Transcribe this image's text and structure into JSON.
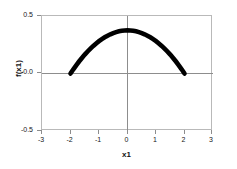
{
  "chart_data": {
    "type": "line",
    "title": "",
    "subtitle": "",
    "xlabel": "x1",
    "ylabel": "f(x1)",
    "xlim": [
      -3,
      3
    ],
    "ylim": [
      -0.5,
      0.5
    ],
    "xticks": [
      "-3",
      "-2",
      "-1",
      "0",
      "1",
      "2",
      "3"
    ],
    "xtick_values": [
      -3,
      -2,
      -1,
      0,
      1,
      2,
      3
    ],
    "yticks": [
      "0.5",
      "0.0",
      "-0.5"
    ],
    "ytick_values": [
      0.5,
      0.0,
      -0.5
    ],
    "grid": false,
    "legend": null,
    "annotations": [],
    "series": [
      {
        "name": "f(x1)",
        "color": "#000000",
        "linewidth": "thick",
        "x": [
          -2.0,
          -1.9,
          -1.8,
          -1.7,
          -1.6,
          -1.5,
          -1.4,
          -1.3,
          -1.2,
          -1.1,
          -1.0,
          -0.9,
          -0.8,
          -0.7,
          -0.6,
          -0.5,
          -0.4,
          -0.3,
          -0.2,
          -0.1,
          0.0,
          0.1,
          0.2,
          0.3,
          0.4,
          0.5,
          0.6,
          0.7,
          0.8,
          0.9,
          1.0,
          1.1,
          1.2,
          1.3,
          1.4,
          1.5,
          1.6,
          1.7,
          1.8,
          1.9,
          2.0
        ],
        "y": [
          0.0,
          0.0366,
          0.0713,
          0.1041,
          0.135,
          0.1641,
          0.1913,
          0.2166,
          0.24,
          0.2616,
          0.2813,
          0.299,
          0.315,
          0.329,
          0.3413,
          0.3516,
          0.36,
          0.3666,
          0.3713,
          0.374,
          0.375,
          0.374,
          0.3713,
          0.3666,
          0.36,
          0.3516,
          0.3413,
          0.329,
          0.315,
          0.299,
          0.2813,
          0.2616,
          0.24,
          0.2166,
          0.1913,
          0.1641,
          0.135,
          0.1041,
          0.0713,
          0.0366,
          0.0
        ],
        "formula": "f(x1) = 0.375 * (1 - (x1/2)^2), domain -2 <= x1 <= 2",
        "peak_x": 0.0,
        "peak_y": 0.375,
        "x_start": -2.0,
        "x_end": 2.0
      }
    ]
  },
  "style": {
    "background": "#ffffff",
    "frame_color": "#b9b9b9",
    "axis_color": "#8d8d8d",
    "curve_color": "#000000",
    "text_color": "#171717"
  }
}
